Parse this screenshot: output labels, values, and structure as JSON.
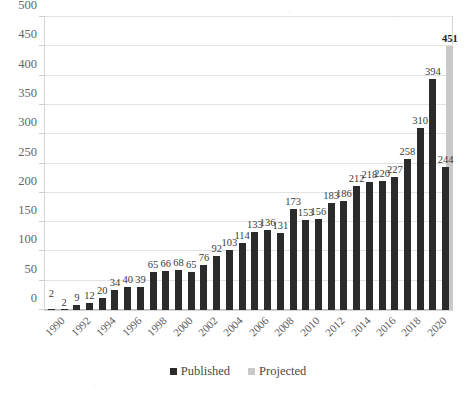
{
  "chart_data": {
    "type": "bar",
    "title": "",
    "subtitle": "",
    "xlabel": "",
    "ylabel": "",
    "ylim": [
      0,
      500
    ],
    "ytick_step": 50,
    "yticks": [
      0,
      50,
      100,
      150,
      200,
      250,
      300,
      350,
      400,
      450,
      500
    ],
    "grid": true,
    "legend_position": "bottom",
    "categories": [
      "1990",
      "1991",
      "1992",
      "1993",
      "1994",
      "1995",
      "1996",
      "1997",
      "1998",
      "1999",
      "2000",
      "2001",
      "2002",
      "2003",
      "2004",
      "2005",
      "2006",
      "2007",
      "2008",
      "2009",
      "2010",
      "2011",
      "2012",
      "2013",
      "2014",
      "2015",
      "2016",
      "2017",
      "2018",
      "2019",
      "2020",
      "2021"
    ],
    "xtick_labels": [
      "1990",
      "1992",
      "1994",
      "1996",
      "1998",
      "2000",
      "2002",
      "2004",
      "2006",
      "2008",
      "2010",
      "2012",
      "2014",
      "2016",
      "2018",
      "2020"
    ],
    "series": [
      {
        "name": "Published",
        "color": "#2b2b2b",
        "values": [
          2,
          2,
          9,
          12,
          20,
          34,
          40,
          39,
          65,
          66,
          68,
          65,
          76,
          92,
          103,
          114,
          133,
          136,
          131,
          173,
          153,
          156,
          183,
          186,
          212,
          218,
          220,
          227,
          258,
          310,
          394,
          244
        ]
      },
      {
        "name": "Projected",
        "color": "#c9c9c9",
        "values": [
          null,
          null,
          null,
          null,
          null,
          null,
          null,
          null,
          null,
          null,
          null,
          null,
          null,
          null,
          null,
          null,
          null,
          null,
          null,
          null,
          null,
          null,
          null,
          null,
          null,
          null,
          null,
          null,
          null,
          null,
          null,
          451
        ]
      }
    ],
    "data_labels": [
      "2",
      "2",
      "9",
      "12",
      "20",
      "34",
      "40",
      "39",
      "65",
      "66",
      "68",
      "65",
      "76",
      "92",
      "103",
      "114",
      "133",
      "136",
      "131",
      "173",
      "153",
      "156",
      "183",
      "186",
      "212",
      "218",
      "220",
      "227",
      "258",
      "310",
      "394",
      "244"
    ],
    "projected_label": "451"
  },
  "legend": {
    "items": [
      {
        "label": "Published",
        "swatch": "published"
      },
      {
        "label": "Projected",
        "swatch": "projected"
      }
    ]
  }
}
